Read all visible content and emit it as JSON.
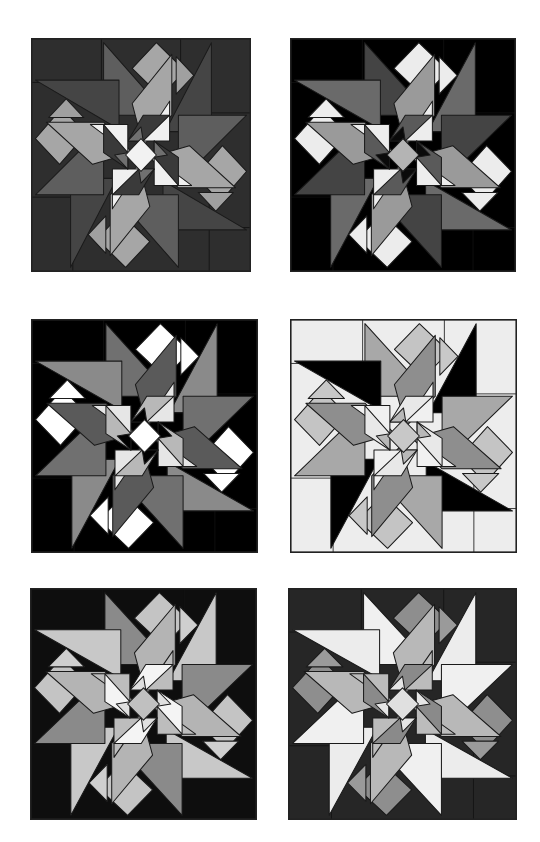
{
  "page": {
    "title": "",
    "background": "#ffffff"
  },
  "blocks": [
    {
      "id": "block-1",
      "position": {
        "x": 31,
        "y": 38,
        "w": 220,
        "h": 234
      },
      "colors": {
        "background": "#2e2e2e",
        "blade_left": "#5e5e5e",
        "blade_right": "#454545",
        "diamond": "#a6a6a6",
        "parallelogram": "#a6a6a6",
        "small_tri": "#a0a0a0",
        "center_tri": "#f0f0f0",
        "kite": "#3a3a3a",
        "kite_inner": "#707070",
        "center": "#f2f2f2"
      }
    },
    {
      "id": "block-2",
      "position": {
        "x": 290,
        "y": 38,
        "w": 226,
        "h": 234
      },
      "colors": {
        "background": "#000000",
        "blade_left": "#444444",
        "blade_right": "#6a6a6a",
        "diamond": "#ececec",
        "parallelogram": "#9a9a9a",
        "small_tri": "#ececec",
        "center_tri": "#ededed",
        "kite": "#5a5a5a",
        "kite_inner": "#0a0a0a",
        "center": "#b4b4b4"
      }
    },
    {
      "id": "block-3",
      "position": {
        "x": 31,
        "y": 319,
        "w": 227,
        "h": 234
      },
      "colors": {
        "background": "#000000",
        "blade_left": "#707070",
        "blade_right": "#8a8a8a",
        "diamond": "#ffffff",
        "parallelogram": "#5a5a5a",
        "small_tri": "#ffffff",
        "center_tri": "#e6e6e6",
        "kite": "#b8b8b8",
        "kite_inner": "#000000",
        "center": "#ffffff"
      }
    },
    {
      "id": "block-4",
      "position": {
        "x": 290,
        "y": 319,
        "w": 227,
        "h": 234
      },
      "colors": {
        "background": "#ededed",
        "blade_left": "#a8a8a8",
        "blade_right": "#000000",
        "diamond": "#c4c4c4",
        "parallelogram": "#8e8e8e",
        "small_tri": "#c8c8c8",
        "center_tri": "#f0f0f0",
        "kite": "#e8e8e8",
        "kite_inner": "#b8b8b8",
        "center": "#c8c8c8"
      }
    },
    {
      "id": "block-5",
      "position": {
        "x": 30,
        "y": 588,
        "w": 227,
        "h": 232
      },
      "colors": {
        "background": "#0e0e0e",
        "blade_left": "#8a8a8a",
        "blade_right": "#c8c8c8",
        "diamond": "#c4c4c4",
        "parallelogram": "#b4b4b4",
        "small_tri": "#cfcfcf",
        "center_tri": "#bdbdbd",
        "kite": "#f4f4f4",
        "kite_inner": "#e0e0e0",
        "center": "#c0c0c0"
      }
    },
    {
      "id": "block-6",
      "position": {
        "x": 288,
        "y": 588,
        "w": 229,
        "h": 232
      },
      "colors": {
        "background": "#262626",
        "blade_left": "#f0f0f0",
        "blade_right": "#ececec",
        "diamond": "#8e8e8e",
        "parallelogram": "#b8b8b8",
        "small_tri": "#9a9a9a",
        "center_tri": "#bcbcbc",
        "kite": "#8a8a8a",
        "kite_inner": "#e6e6e6",
        "center": "#e0e0e0"
      }
    }
  ]
}
